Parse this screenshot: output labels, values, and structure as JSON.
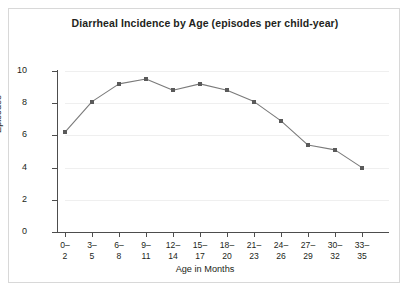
{
  "chart_data": {
    "type": "line",
    "title": "Diarrheal Incidence by Age (episodes per child-year)",
    "xlabel": "Age in Months",
    "ylabel": "Episodes",
    "categories": [
      "0–\n2",
      "3–\n5",
      "6–\n8",
      "9–\n11",
      "12–\n14",
      "15–\n17",
      "18–\n20",
      "21–\n23",
      "24–\n26",
      "27–\n29",
      "30–\n32",
      "33–\n35"
    ],
    "values": [
      6.2,
      8.1,
      9.2,
      9.5,
      8.8,
      9.2,
      8.8,
      8.1,
      6.9,
      5.4,
      5.1,
      4.0
    ],
    "ylim": [
      0,
      10
    ],
    "yticks": [
      0,
      2,
      4,
      6,
      8,
      10
    ],
    "ytick_labels": [
      "0",
      "2",
      "4",
      "6",
      "8",
      "10"
    ],
    "grid": true,
    "legend": false,
    "marker": "square",
    "series_color": "#5a5a5a",
    "line_color": "#7a7a7a",
    "grid_color": "#efefef",
    "axis_color": "#4d4d4d",
    "text_color": "#231f20"
  }
}
